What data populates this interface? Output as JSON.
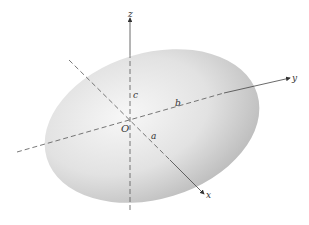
{
  "diagram": {
    "type": "ellipsoid",
    "axes": [
      {
        "name": "x",
        "label": "x"
      },
      {
        "name": "y",
        "label": "y"
      },
      {
        "name": "z",
        "label": "z"
      }
    ],
    "semi_axes": [
      {
        "name": "a",
        "label": "a"
      },
      {
        "name": "b",
        "label": "b"
      },
      {
        "name": "c",
        "label": "c"
      }
    ],
    "origin_label": "O",
    "colors": {
      "ellipsoid_light": "#f4f4f4",
      "ellipsoid_dark": "#bdbdbd",
      "axis_line": "#555555"
    }
  }
}
